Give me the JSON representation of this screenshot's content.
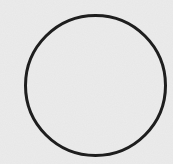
{
  "figure": {
    "shape": "circle",
    "center": [
      95.5,
      85.5
    ],
    "radius": 70,
    "stroke_width": 3,
    "stroke_color": "#1e1e1e",
    "background_color": "#ececec"
  }
}
